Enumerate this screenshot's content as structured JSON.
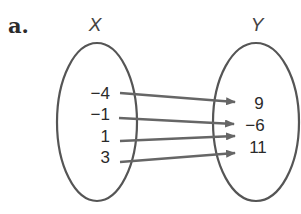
{
  "part_label": "a.",
  "domain_set": {
    "label": "X",
    "values": [
      "−4",
      "−1",
      "1",
      "3"
    ]
  },
  "range_set": {
    "label": "Y",
    "values": [
      "9",
      "−6",
      "11"
    ]
  },
  "mapping": [
    {
      "from": "−4",
      "to": "9"
    },
    {
      "from": "−1",
      "to": "−6"
    },
    {
      "from": "1",
      "to": "−6"
    },
    {
      "from": "3",
      "to": "11"
    }
  ],
  "colors": {
    "ellipse_stroke": "#555555",
    "arrow": "#666666",
    "text": "#2a2a2a"
  }
}
